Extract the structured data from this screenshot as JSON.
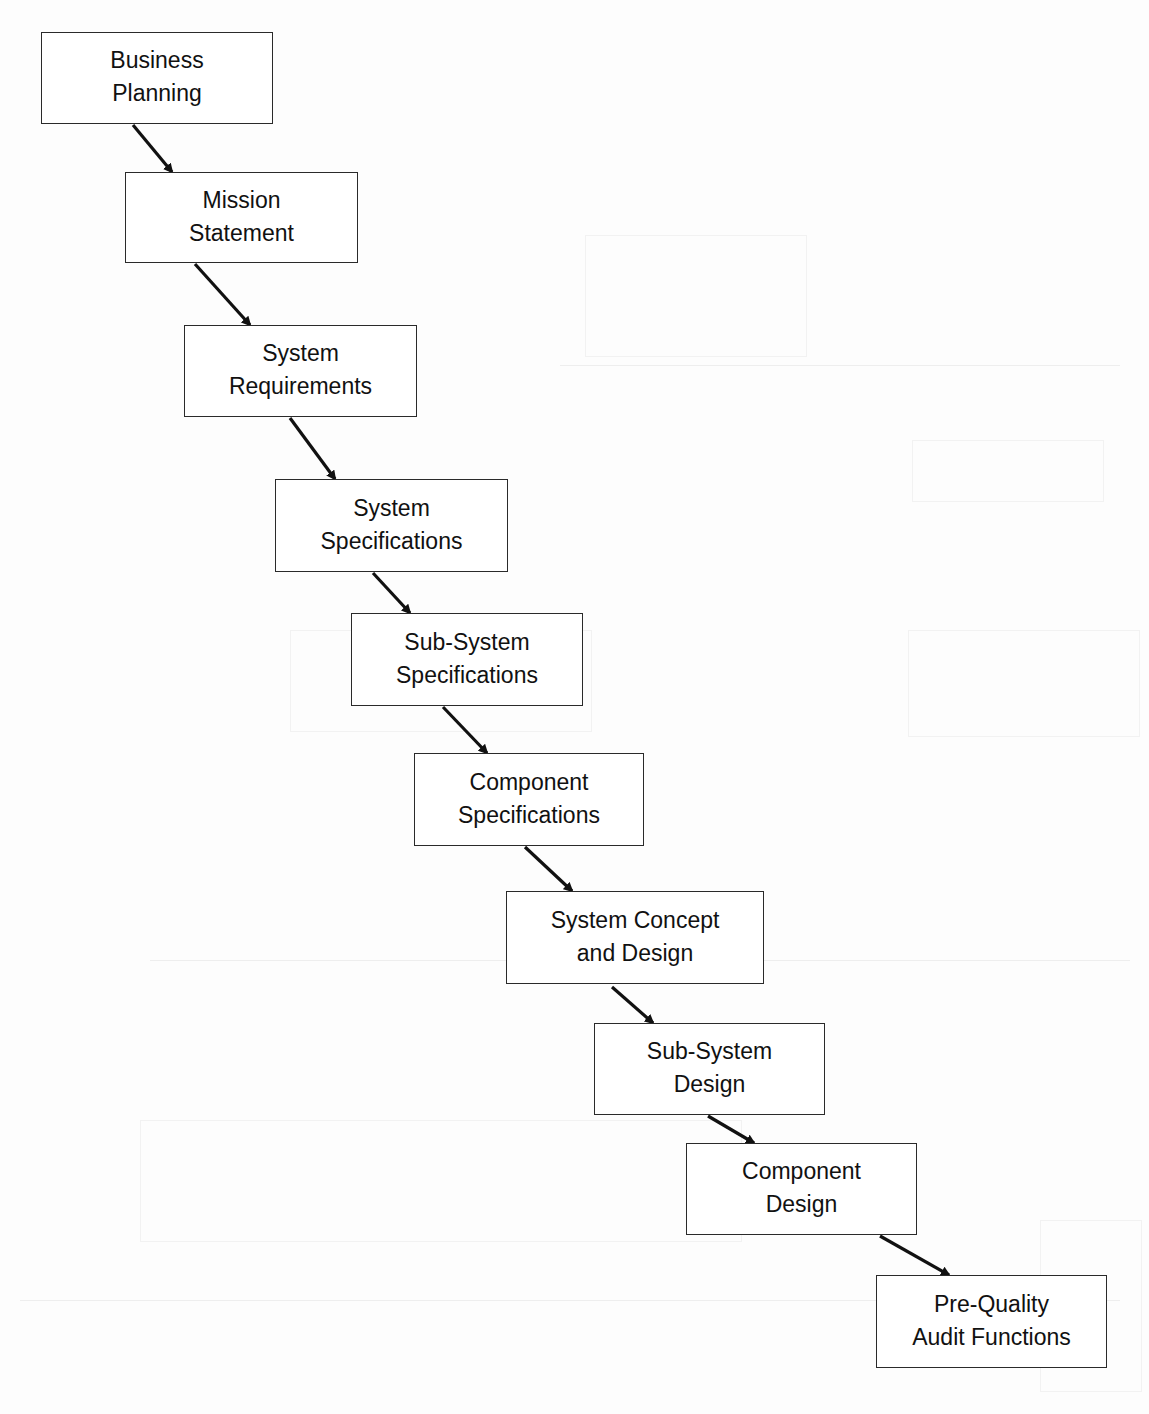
{
  "diagram": {
    "type": "waterfall-flow",
    "direction": "top-left to bottom-right",
    "colors": {
      "page": "#fdfdfd",
      "box_border": "#2a2a2a",
      "box_fill": "#ffffff",
      "text": "#111111",
      "arrow": "#111111"
    },
    "nodes": [
      {
        "id": "business-planning",
        "label": "Business\nPlanning",
        "x": 41,
        "y": 32,
        "w": 232,
        "h": 92
      },
      {
        "id": "mission-statement",
        "label": "Mission\nStatement",
        "x": 125,
        "y": 172,
        "w": 233,
        "h": 91
      },
      {
        "id": "system-requirements",
        "label": "System\nRequirements",
        "x": 184,
        "y": 325,
        "w": 233,
        "h": 92
      },
      {
        "id": "system-specifications",
        "label": "System\nSpecifications",
        "x": 275,
        "y": 479,
        "w": 233,
        "h": 93
      },
      {
        "id": "sub-system-specifications",
        "label": "Sub-System\nSpecifications",
        "x": 351,
        "y": 613,
        "w": 232,
        "h": 93
      },
      {
        "id": "component-specifications",
        "label": "Component\nSpecifications",
        "x": 414,
        "y": 753,
        "w": 230,
        "h": 93
      },
      {
        "id": "system-concept-and-design",
        "label": "System Concept\nand Design",
        "x": 506,
        "y": 891,
        "w": 258,
        "h": 93
      },
      {
        "id": "sub-system-design",
        "label": "Sub-System\nDesign",
        "x": 594,
        "y": 1023,
        "w": 231,
        "h": 92
      },
      {
        "id": "component-design",
        "label": "Component\nDesign",
        "x": 686,
        "y": 1143,
        "w": 231,
        "h": 92
      },
      {
        "id": "pre-quality-audit-functions",
        "label": "Pre-Quality\nAudit Functions",
        "x": 876,
        "y": 1275,
        "w": 231,
        "h": 93
      }
    ],
    "edges": [
      {
        "from": "business-planning",
        "to": "mission-statement",
        "x1": 133,
        "y1": 125,
        "x2": 172,
        "y2": 172
      },
      {
        "from": "mission-statement",
        "to": "system-requirements",
        "x1": 195,
        "y1": 264,
        "x2": 250,
        "y2": 325
      },
      {
        "from": "system-requirements",
        "to": "system-specifications",
        "x1": 290,
        "y1": 418,
        "x2": 335,
        "y2": 479
      },
      {
        "from": "system-specifications",
        "to": "sub-system-specifications",
        "x1": 373,
        "y1": 573,
        "x2": 410,
        "y2": 613
      },
      {
        "from": "sub-system-specifications",
        "to": "component-specifications",
        "x1": 443,
        "y1": 707,
        "x2": 487,
        "y2": 753
      },
      {
        "from": "component-specifications",
        "to": "system-concept-and-design",
        "x1": 525,
        "y1": 847,
        "x2": 572,
        "y2": 891
      },
      {
        "from": "system-concept-and-design",
        "to": "sub-system-design",
        "x1": 612,
        "y1": 987,
        "x2": 653,
        "y2": 1023
      },
      {
        "from": "sub-system-design",
        "to": "component-design",
        "x1": 708,
        "y1": 1116,
        "x2": 754,
        "y2": 1143
      },
      {
        "from": "component-design",
        "to": "pre-quality-audit-functions",
        "x1": 880,
        "y1": 1236,
        "x2": 949,
        "y2": 1275
      }
    ]
  }
}
